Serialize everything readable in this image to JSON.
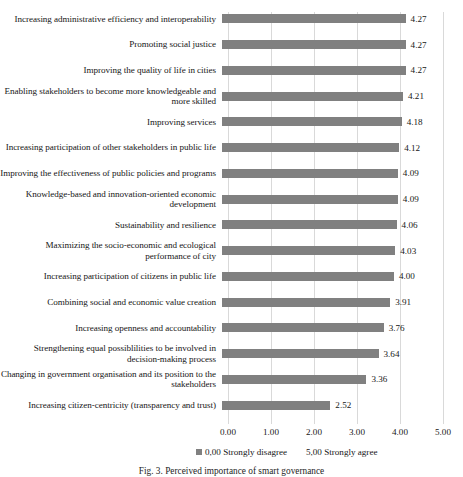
{
  "chart_data": {
    "type": "bar",
    "orientation": "horizontal",
    "title": "",
    "xlabel": "",
    "ylabel": "",
    "xlim": [
      0,
      5
    ],
    "grid": true,
    "bar_color": "#808080",
    "categories": [
      "Increasing administrative efficiency and interoperability",
      "Promoting social justice",
      "Improving the quality of life in cities",
      "Enabling stakeholders to become more knowledgeable and more skilled",
      "Improving services",
      "Increasing participation of other stakeholders in public life",
      "Improving the effectiveness of public policies and programs",
      "Knowledge-based and innovation-oriented economic development",
      "Sustainability and resilience",
      "Maximizing the socio-economic and ecological performance of city",
      "Increasing participation of citizens in public life",
      "Combining social and economic value creation",
      "Increasing openness and accountability",
      "Strengthening equal possiblilities to be involved in decision-making process",
      "Changing in government organisation and its position to the stakeholders",
      "Increasing citizen-centricity (transparency and trust)"
    ],
    "values": [
      4.27,
      4.27,
      4.27,
      4.21,
      4.18,
      4.12,
      4.09,
      4.09,
      4.06,
      4.03,
      4.0,
      3.91,
      3.76,
      3.64,
      3.36,
      2.52
    ],
    "value_labels": [
      "4.27",
      "4.27",
      "4.27",
      "4.21",
      "4.18",
      "4.12",
      "4.09",
      "4.09",
      "4.06",
      "4.03",
      "4.00",
      "3.91",
      "3.76",
      "3.64",
      "3.36",
      "2.52"
    ],
    "xticks": [
      0,
      1,
      2,
      3,
      4,
      5
    ],
    "xtick_labels": [
      "0.00",
      "1.00",
      "2.00",
      "3.00",
      "4.00",
      "5.00"
    ],
    "legend_position": "bottom",
    "legend": [
      {
        "label": "0,00 Strongly disagree",
        "swatch": true
      },
      {
        "label": "5,00 Strongly agree",
        "swatch": false
      }
    ]
  },
  "caption": {
    "label": "Fig. 3.",
    "text": "Perceived importance of smart governance"
  }
}
